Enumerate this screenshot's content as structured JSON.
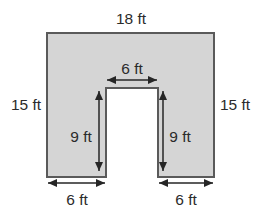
{
  "figure": {
    "shape_fill": "#d5d5d5",
    "shape_stroke": "#5a5a5a",
    "arrow_color": "#262626",
    "labels": {
      "top_width": "18 ft",
      "left_height": "15 ft",
      "right_height": "15 ft",
      "notch_width": "6 ft",
      "notch_depth_left": "9 ft",
      "notch_depth_right": "9 ft",
      "bottom_left_width": "6 ft",
      "bottom_right_width": "6 ft"
    }
  }
}
